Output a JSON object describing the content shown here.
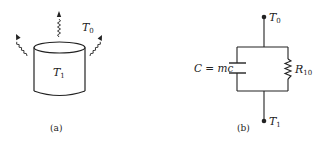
{
  "figure_a": {
    "caption": "(a)",
    "body_label": "T",
    "body_label_sub": "1",
    "ambient_label": "T",
    "ambient_label_sub": "0"
  },
  "figure_b": {
    "caption": "(b)",
    "top_node_label": "T",
    "top_node_label_sub": "0",
    "bottom_node_label": "T",
    "bottom_node_label_sub": "1",
    "capacitor_label": "C = mc",
    "resistor_label": "R",
    "resistor_label_sub": "10"
  },
  "colors": {
    "stroke": "#222222",
    "background": "#ffffff"
  }
}
